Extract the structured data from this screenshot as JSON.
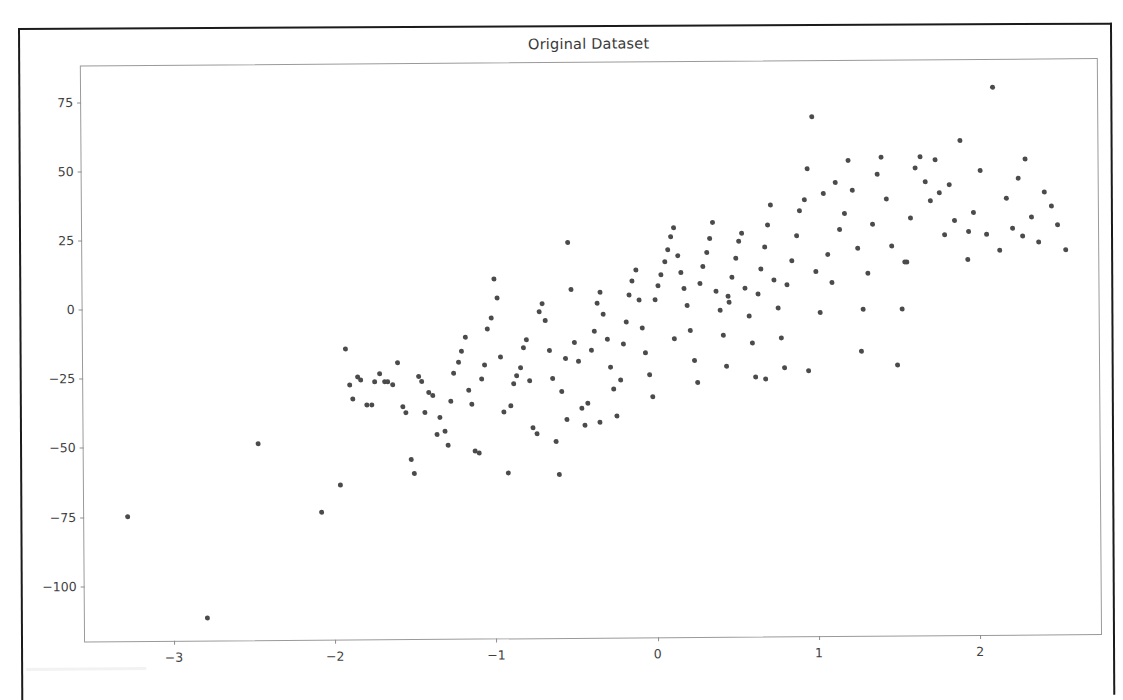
{
  "chart_data": {
    "type": "scatter",
    "title": "Original Dataset",
    "xlabel": "",
    "ylabel": "",
    "xlim": [
      -3.55,
      2.75
    ],
    "ylim": [
      -120,
      88
    ],
    "xticks": [
      -3,
      -2,
      -1,
      0,
      1,
      2
    ],
    "yticks": [
      75,
      50,
      25,
      0,
      -25,
      -50,
      -75,
      -100
    ],
    "xticklabels": [
      "−3",
      "−2",
      "−1",
      "0",
      "1",
      "2"
    ],
    "yticklabels": [
      "75",
      "50",
      "25",
      "0",
      "−25",
      "−50",
      "−75",
      "−100"
    ],
    "grid": false,
    "legend": null,
    "marker_color": "#4b4b4b",
    "marker_size": 5,
    "n_points": 200,
    "series": [
      {
        "name": "samples",
        "x": [
          -3.28,
          -2.79,
          -2.47,
          -2.08,
          -1.96,
          -1.92,
          -1.9,
          -1.88,
          -1.85,
          -1.83,
          -1.79,
          -1.76,
          -1.74,
          -1.71,
          -1.68,
          -1.66,
          -1.63,
          -1.6,
          -1.57,
          -1.55,
          -1.52,
          -1.5,
          -1.47,
          -1.45,
          -1.43,
          -1.41,
          -1.38,
          -1.36,
          -1.34,
          -1.31,
          -1.29,
          -1.27,
          -1.25,
          -1.22,
          -1.2,
          -1.18,
          -1.16,
          -1.14,
          -1.12,
          -1.1,
          -1.08,
          -1.06,
          -1.04,
          -1.02,
          -1.0,
          -0.98,
          -0.96,
          -0.94,
          -0.92,
          -0.9,
          -0.88,
          -0.86,
          -0.84,
          -0.82,
          -0.8,
          -0.78,
          -0.76,
          -0.74,
          -0.72,
          -0.7,
          -0.68,
          -0.66,
          -0.64,
          -0.62,
          -0.6,
          -0.58,
          -0.56,
          -0.54,
          -0.52,
          -0.5,
          -0.48,
          -0.46,
          -0.44,
          -0.42,
          -0.4,
          -0.38,
          -0.36,
          -0.34,
          -0.32,
          -0.3,
          -0.28,
          -0.26,
          -0.24,
          -0.22,
          -0.2,
          -0.18,
          -0.16,
          -0.14,
          -0.12,
          -0.1,
          -0.08,
          -0.06,
          -0.04,
          -0.02,
          0.0,
          0.02,
          0.04,
          0.06,
          0.08,
          0.1,
          0.12,
          0.14,
          0.16,
          0.18,
          0.2,
          0.22,
          0.24,
          0.26,
          0.28,
          0.3,
          0.32,
          0.34,
          0.36,
          0.38,
          0.4,
          0.42,
          0.44,
          0.46,
          0.48,
          0.5,
          0.52,
          0.54,
          0.56,
          0.58,
          0.6,
          0.62,
          0.64,
          0.66,
          0.68,
          0.7,
          0.72,
          0.74,
          0.76,
          0.78,
          0.8,
          0.82,
          0.85,
          0.88,
          0.9,
          0.93,
          0.95,
          0.98,
          1.0,
          1.02,
          1.05,
          1.07,
          1.1,
          1.12,
          1.15,
          1.18,
          1.2,
          1.23,
          1.26,
          1.29,
          1.32,
          1.35,
          1.38,
          1.41,
          1.44,
          1.47,
          1.5,
          1.53,
          1.56,
          1.59,
          1.62,
          1.65,
          1.68,
          1.71,
          1.74,
          1.77,
          1.8,
          1.83,
          1.86,
          1.9,
          1.94,
          1.98,
          2.02,
          2.06,
          2.1,
          2.14,
          2.18,
          2.22,
          2.26,
          2.3,
          2.34,
          2.38,
          2.42,
          2.46,
          2.5,
          2.55,
          -0.55,
          -0.35,
          0.12,
          0.45,
          0.68,
          0.95,
          1.28,
          1.55,
          1.95,
          2.28
        ],
        "y": [
          -75,
          -112,
          -49,
          -74,
          -64,
          -15,
          -28,
          -33,
          -25,
          -26,
          -35,
          -35,
          -27,
          -24,
          -27,
          -27,
          -28,
          -20,
          -36,
          -38,
          -55,
          -60,
          -25,
          -27,
          -38,
          -31,
          -32,
          -46,
          -40,
          -45,
          -50,
          -34,
          -24,
          -20,
          -16,
          -11,
          -30,
          -35,
          -52,
          -53,
          -26,
          -21,
          -8,
          -4,
          10,
          3,
          -18,
          -38,
          -60,
          -36,
          -28,
          -25,
          -22,
          -15,
          -12,
          -27,
          -44,
          -46,
          -2,
          1,
          -5,
          -16,
          -26,
          -49,
          -61,
          -31,
          -19,
          23,
          6,
          -13,
          -20,
          -37,
          -43,
          -35,
          -16,
          -9,
          1,
          5,
          -3,
          -12,
          -22,
          -30,
          -40,
          -27,
          -14,
          -6,
          4,
          9,
          13,
          2,
          -8,
          -17,
          -25,
          -33,
          2,
          7,
          11,
          16,
          20,
          25,
          28,
          18,
          12,
          6,
          0,
          -9,
          -20,
          -28,
          8,
          14,
          19,
          24,
          30,
          5,
          -2,
          -11,
          -22,
          1,
          10,
          17,
          23,
          26,
          6,
          -4,
          -14,
          -26,
          4,
          13,
          21,
          29,
          36,
          9,
          -1,
          -12,
          -23,
          7,
          16,
          25,
          34,
          38,
          49,
          68,
          12,
          -3,
          40,
          18,
          8,
          44,
          27,
          33,
          52,
          41,
          20,
          -2,
          11,
          29,
          47,
          53,
          38,
          21,
          -22,
          -2,
          15,
          31,
          49,
          53,
          44,
          37,
          52,
          40,
          25,
          43,
          30,
          59,
          16,
          33,
          48,
          25,
          78,
          19,
          38,
          27,
          45,
          52,
          31,
          22,
          40,
          35,
          28,
          19,
          -41,
          -42,
          -12,
          3,
          -27,
          -24,
          -17,
          15,
          26,
          24
        ]
      }
    ]
  },
  "page": {
    "background": "#ffffff",
    "border_color": "#1b1b1b",
    "axes_border_color": "#9a9a9a",
    "tick_color": "#8d8d8d",
    "text_color": "#3f3f3f"
  }
}
